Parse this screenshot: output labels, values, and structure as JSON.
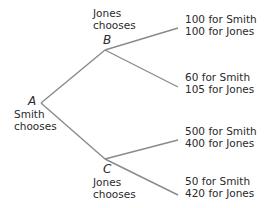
{
  "diagram": {
    "type": "game-tree",
    "line_color": "#8a8a8a",
    "nodes": {
      "A": {
        "letter": "A",
        "caption_line1": "Smith",
        "caption_line2": "chooses"
      },
      "B": {
        "letter": "B",
        "caption_line1": "Jones",
        "caption_line2": "chooses"
      },
      "C": {
        "letter": "C",
        "caption_line1": "Jones",
        "caption_line2": "chooses"
      }
    },
    "outcomes": [
      {
        "from": "B",
        "smith": "100 for Smith",
        "jones": "100 for Jones"
      },
      {
        "from": "B",
        "smith": "60 for Smith",
        "jones": "105 for Jones"
      },
      {
        "from": "C",
        "smith": "500 for Smith",
        "jones": "400 for Jones"
      },
      {
        "from": "C",
        "smith": "50 for Smith",
        "jones": "420 for Jones"
      }
    ]
  }
}
